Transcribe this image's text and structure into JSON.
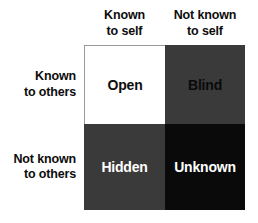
{
  "diagram": {
    "columns": [
      {
        "id": "known-to-self",
        "line1": "Known",
        "line2": "to self"
      },
      {
        "id": "not-known-to-self",
        "line1": "Not known",
        "line2": "to self"
      }
    ],
    "rows": [
      {
        "id": "known-to-others",
        "line1": "Known",
        "line2": "to others"
      },
      {
        "id": "not-known-to-others",
        "line1": "Not known",
        "line2": "to others"
      }
    ],
    "quadrants": [
      {
        "id": "open",
        "label": "Open",
        "fill": "#ffffff",
        "text_color": "#0d0d0d"
      },
      {
        "id": "blind",
        "label": "Blind",
        "fill": "#3a3a3a",
        "text_color": "#0a0a0a"
      },
      {
        "id": "hidden",
        "label": "Hidden",
        "fill": "#3a3a3a",
        "text_color": "#ffffff"
      },
      {
        "id": "unknown",
        "label": "Unknown",
        "fill": "#0a0a0a",
        "text_color": "#ffffff"
      }
    ],
    "colors": {
      "background": "#ffffff",
      "label_text": "#0d0d0d",
      "border": "#9a9a9a"
    }
  }
}
